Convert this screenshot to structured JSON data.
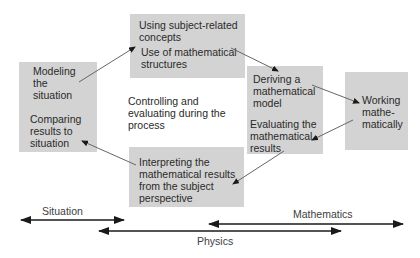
{
  "diagram": {
    "colors": {
      "box_fill": "#d3d3d3",
      "thin_arrow": "#555555",
      "thick_arrow": "#1a1a1a"
    },
    "boxes": {
      "situation_box": {
        "modeling": "Modeling\nthe\nsituation",
        "comparing": "Comparing\nresults to\nsituation"
      },
      "subject_box": {
        "concepts": "Using subject-related\nconcepts",
        "structures": "Use of mathematical\nstructures"
      },
      "model_box": {
        "deriving": "Deriving a\nmathematical\nmodel",
        "evaluating": "Evaluating the\nmathematical\nresults"
      },
      "working_box": {
        "working": "Working\nmathe-\nmatically"
      },
      "interpreting_box": {
        "interpreting": "Interpreting the\nmathematical results\nfrom the subject\nperspective"
      }
    },
    "center_text": "Controlling and\nevaluating during the\nprocess",
    "flow_arrows": [
      {
        "from": "Modeling the situation",
        "to": "Using subject-related concepts"
      },
      {
        "from": "Use of mathematical structures",
        "to": "Deriving a mathematical model"
      },
      {
        "from": "Deriving a mathematical model",
        "to": "Working mathematically"
      },
      {
        "from": "Working mathematically",
        "to": "Evaluating the mathematical results"
      },
      {
        "from": "Evaluating the mathematical results",
        "to": "Interpreting the mathematical results from the subject perspective"
      },
      {
        "from": "Interpreting the mathematical results from the subject perspective",
        "to": "Comparing results to situation"
      }
    ],
    "ranges": {
      "situation": "Situation",
      "physics": "Physics",
      "mathematics": "Mathematics"
    }
  }
}
